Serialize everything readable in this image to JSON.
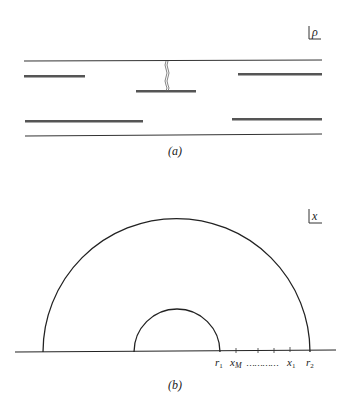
{
  "figure_a": {
    "caption": "(a)",
    "axis_label": "ρ",
    "lines": {
      "top_boundary": {
        "x1": 24,
        "x2": 322,
        "y": 61
      },
      "bottom_boundary": {
        "x1": 25,
        "x2": 322,
        "y": 136
      }
    },
    "bars": [
      {
        "name": "upper-left-plate",
        "x1": 24,
        "x2": 84,
        "y": 76
      },
      {
        "name": "upper-right-plate",
        "x1": 238,
        "x2": 322,
        "y": 74
      },
      {
        "name": "middle-plate",
        "x1": 136,
        "x2": 196,
        "y": 91
      },
      {
        "name": "lower-left-plate",
        "x1": 25,
        "x2": 143,
        "y": 121
      },
      {
        "name": "lower-right-plate",
        "x1": 232,
        "x2": 322,
        "y": 119
      }
    ],
    "wavy_connector": {
      "x": 166,
      "y1": 61,
      "y2": 91
    }
  },
  "figure_b": {
    "caption": "(b)",
    "axis_label": "x",
    "baseline": {
      "x1": 15,
      "x2": 336,
      "y": 352
    },
    "outer_semicircle": {
      "cx": 176.5,
      "cy": 352,
      "r": 133.5
    },
    "inner_semicircle": {
      "cx": 176.5,
      "cy": 352,
      "r": 43
    },
    "ticks_x": [
      236,
      258,
      274,
      290
    ],
    "labels": {
      "r1": "r",
      "r1_sub": "1",
      "xM": "x",
      "xM_sub": "M",
      "dots": "…………",
      "x1": "x",
      "x1_sub": "1",
      "r2": "r",
      "r2_sub": "2"
    }
  }
}
